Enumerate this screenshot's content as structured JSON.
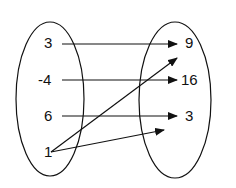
{
  "diagram": {
    "type": "mapping",
    "domain_set": {
      "elements": [
        "3",
        "-4",
        "6",
        "1"
      ]
    },
    "range_set": {
      "elements": [
        "9",
        "16",
        "3"
      ]
    },
    "mappings": [
      {
        "from": "3",
        "to": "9"
      },
      {
        "from": "-4",
        "to": "16"
      },
      {
        "from": "6",
        "to": "3"
      },
      {
        "from": "1",
        "to": "9"
      },
      {
        "from": "1",
        "to": "3"
      }
    ],
    "colors": {
      "stroke": "#111111",
      "background": "#ffffff"
    }
  }
}
